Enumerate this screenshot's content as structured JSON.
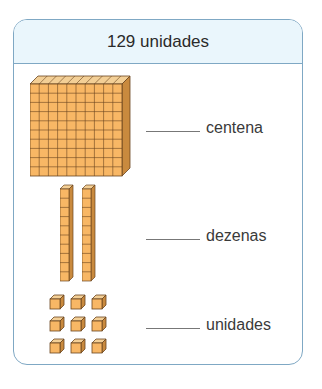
{
  "header": {
    "title": "129 unidades"
  },
  "rows": [
    {
      "label": "centena",
      "blank": ""
    },
    {
      "label": "dezenas",
      "blank": ""
    },
    {
      "label": "unidades",
      "blank": ""
    }
  ],
  "blocks": {
    "hundreds": 1,
    "tens": 2,
    "units": 9
  },
  "colors": {
    "block_face": "#f8b765",
    "block_top": "#f3cf96",
    "block_side": "#c98a3e",
    "edge": "#6a4520",
    "border": "#7fa8c4",
    "header_bg": "#eaf6fc"
  }
}
